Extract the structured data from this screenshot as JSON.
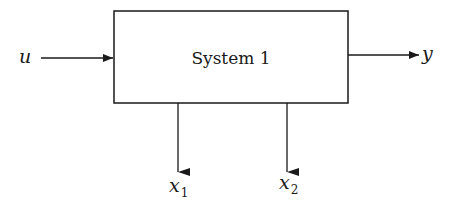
{
  "diagram": {
    "type": "block-diagram",
    "block": {
      "label": "System 1"
    },
    "input": {
      "label": "u"
    },
    "output": {
      "label": "y"
    },
    "states": [
      {
        "label": "x",
        "subscript": "1"
      },
      {
        "label": "x",
        "subscript": "2"
      }
    ],
    "colors": {
      "stroke": "#1a1a1a",
      "background": "#ffffff"
    }
  }
}
